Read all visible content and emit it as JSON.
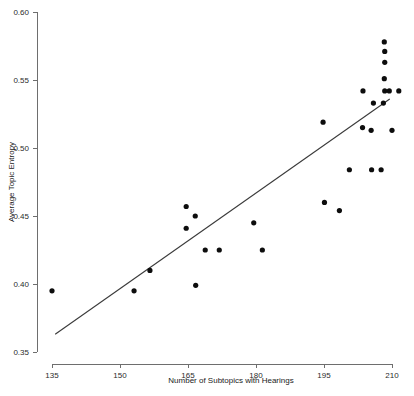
{
  "chart_data": {
    "type": "scatter",
    "title": "",
    "xlabel": "Number of Subtopics with Hearings",
    "ylabel": "Average Topic Entropy",
    "xlim": [
      131,
      213
    ],
    "ylim": [
      0.338,
      0.605
    ],
    "xticks": [
      135,
      150,
      165,
      180,
      195,
      210
    ],
    "yticks": [
      "0.35",
      "0.40",
      "0.45",
      "0.50",
      "0.55",
      "0.60"
    ],
    "ytick_values": [
      0.35,
      0.4,
      0.45,
      0.5,
      0.55,
      0.6
    ],
    "grid": false,
    "legend": false,
    "points": [
      {
        "x": 135.0,
        "y": 0.395
      },
      {
        "x": 156.6,
        "y": 0.41
      },
      {
        "x": 153.1,
        "y": 0.395
      },
      {
        "x": 164.6,
        "y": 0.457
      },
      {
        "x": 166.6,
        "y": 0.45
      },
      {
        "x": 164.6,
        "y": 0.441
      },
      {
        "x": 166.7,
        "y": 0.399
      },
      {
        "x": 168.8,
        "y": 0.425
      },
      {
        "x": 171.9,
        "y": 0.425
      },
      {
        "x": 179.5,
        "y": 0.445
      },
      {
        "x": 181.4,
        "y": 0.425
      },
      {
        "x": 194.8,
        "y": 0.519
      },
      {
        "x": 195.1,
        "y": 0.46
      },
      {
        "x": 198.4,
        "y": 0.454
      },
      {
        "x": 200.6,
        "y": 0.484
      },
      {
        "x": 203.5,
        "y": 0.515
      },
      {
        "x": 205.5,
        "y": 0.484
      },
      {
        "x": 207.6,
        "y": 0.484
      },
      {
        "x": 205.9,
        "y": 0.533
      },
      {
        "x": 208.1,
        "y": 0.533
      },
      {
        "x": 205.4,
        "y": 0.513
      },
      {
        "x": 209.4,
        "y": 0.542
      },
      {
        "x": 210.0,
        "y": 0.513
      },
      {
        "x": 208.4,
        "y": 0.542
      },
      {
        "x": 208.3,
        "y": 0.551
      },
      {
        "x": 208.4,
        "y": 0.563
      },
      {
        "x": 208.4,
        "y": 0.571
      },
      {
        "x": 208.3,
        "y": 0.578
      },
      {
        "x": 203.6,
        "y": 0.542
      },
      {
        "x": 211.5,
        "y": 0.542
      }
    ],
    "trend_line": {
      "x_start": 135.7,
      "y_start": 0.363,
      "x_end": 209.5,
      "y_end": 0.536
    }
  }
}
